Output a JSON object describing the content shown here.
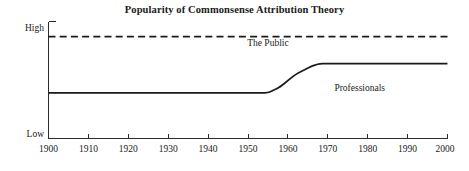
{
  "chart_data": {
    "type": "line",
    "title": "Popularity of Commonsense Attribution Theory",
    "xlabel": "",
    "ylabel": "",
    "xlim": [
      1900,
      2000
    ],
    "ylim": [
      0,
      100
    ],
    "grid": false,
    "legend_position": "inline-annotation",
    "x_tick_labels": [
      "1900",
      "1910",
      "1920",
      "1930",
      "1940",
      "1950",
      "1960",
      "1970",
      "1980",
      "1990",
      "2000"
    ],
    "x_ticks": [
      1900,
      1910,
      1920,
      1930,
      1940,
      1950,
      1960,
      1970,
      1980,
      1990,
      2000
    ],
    "y_tick_labels": [
      "High",
      "Low"
    ],
    "y_ticks": [
      100,
      0
    ],
    "annotations": [
      {
        "text": "The Public",
        "x": 1955,
        "y": 79
      },
      {
        "text": "Professionals",
        "x": 1978,
        "y": 41
      }
    ],
    "series": [
      {
        "name": "The Public",
        "style": "dashed",
        "color": "#1a1a1a",
        "x": [
          1900,
          2000
        ],
        "values": [
          87,
          87
        ]
      },
      {
        "name": "Professionals",
        "style": "solid",
        "color": "#1a1a1a",
        "x": [
          1900,
          1955,
          1958,
          1962,
          1966,
          1968,
          2000
        ],
        "values": [
          39,
          39,
          44,
          55,
          62,
          64,
          64
        ]
      }
    ]
  },
  "axis": {
    "high_label": "High",
    "low_label": "Low"
  }
}
